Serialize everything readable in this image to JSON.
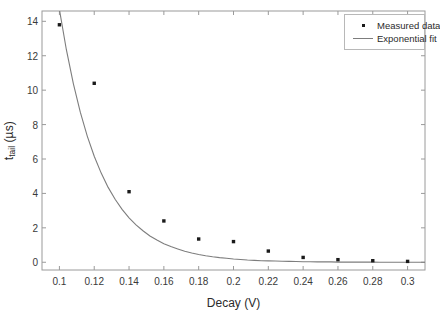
{
  "chart_data": {
    "type": "scatter",
    "title": "",
    "xlabel": "Decay (V)",
    "ylabel_main": "t",
    "ylabel_sub": "tail",
    "ylabel_units": " (µs)",
    "ylabel": "t_tail (µs)",
    "xlim": [
      0.09,
      0.31
    ],
    "ylim": [
      -0.45,
      14.6
    ],
    "xticks": [
      0.1,
      0.12,
      0.14,
      0.16,
      0.18,
      0.2,
      0.22,
      0.24,
      0.26,
      0.28,
      0.3
    ],
    "xtick_labels": [
      "0.1",
      "0.12",
      "0.14",
      "0.16",
      "0.18",
      "0.2",
      "0.22",
      "0.24",
      "0.26",
      "0.28",
      "0.3"
    ],
    "yticks": [
      0,
      2,
      4,
      6,
      8,
      10,
      12,
      14
    ],
    "ytick_labels": [
      "0",
      "2",
      "4",
      "6",
      "8",
      "10",
      "12",
      "14"
    ],
    "grid": false,
    "legend_position": "top-right",
    "series": [
      {
        "name": "Measured data",
        "kind": "scatter",
        "marker": "square",
        "color": "#1a1a1a",
        "x": [
          0.1,
          0.12,
          0.14,
          0.16,
          0.18,
          0.2,
          0.22,
          0.24,
          0.26,
          0.28,
          0.3
        ],
        "values": [
          13.8,
          10.4,
          4.1,
          2.4,
          1.35,
          1.2,
          0.65,
          0.28,
          0.15,
          0.09,
          0.05
        ]
      },
      {
        "name": "Exponential fit",
        "kind": "line",
        "color": "#7d7d7d",
        "x": [
          0.092,
          0.096,
          0.1,
          0.104,
          0.108,
          0.112,
          0.116,
          0.12,
          0.124,
          0.128,
          0.132,
          0.136,
          0.14,
          0.144,
          0.148,
          0.152,
          0.156,
          0.16,
          0.164,
          0.168,
          0.172,
          0.176,
          0.18,
          0.184,
          0.188,
          0.192,
          0.196,
          0.2,
          0.204,
          0.208,
          0.212,
          0.216,
          0.22,
          0.224,
          0.228,
          0.232,
          0.236,
          0.24,
          0.244,
          0.248,
          0.252,
          0.256,
          0.26,
          0.264,
          0.268,
          0.272,
          0.276,
          0.28,
          0.284,
          0.288,
          0.292,
          0.296,
          0.3,
          0.305,
          0.31
        ],
        "values": [
          20.8,
          17.48,
          14.69,
          12.35,
          10.38,
          8.72,
          7.33,
          6.16,
          5.18,
          4.35,
          3.66,
          3.07,
          2.58,
          2.17,
          1.83,
          1.53,
          1.29,
          1.08,
          0.91,
          0.77,
          0.64,
          0.54,
          0.45,
          0.38,
          0.32,
          0.27,
          0.23,
          0.19,
          0.16,
          0.13,
          0.11,
          0.09,
          0.08,
          0.07,
          0.06,
          0.05,
          0.04,
          0.03,
          0.03,
          0.02,
          0.02,
          0.02,
          0.01,
          0.01,
          0.01,
          0.01,
          0.01,
          0.01,
          0.0,
          0.0,
          0.0,
          0.0,
          0.0,
          0.0,
          0.0
        ]
      }
    ],
    "legend": [
      {
        "label": "Measured data",
        "key": "marker"
      },
      {
        "label": "Exponential fit",
        "key": "line"
      }
    ]
  }
}
